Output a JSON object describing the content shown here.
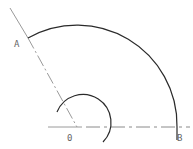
{
  "diagram": {
    "type": "geometry-construction",
    "points": {
      "A": {
        "label": "A",
        "x": 28,
        "y": 38
      },
      "O": {
        "label": "0",
        "x": 77,
        "y": 127
      },
      "B": {
        "label": "B",
        "x": 177,
        "y": 127
      }
    },
    "labels": {
      "A": "A",
      "O": "0",
      "B": "B"
    },
    "colors": {
      "stroke": "#2a2a2a",
      "thin_stroke": "#9a9a9a",
      "label": "#666666"
    },
    "large_arc": {
      "center": "O",
      "radius": 100,
      "from": "A",
      "to": "B"
    },
    "small_arc": {
      "center": "O",
      "radius": 28
    }
  }
}
